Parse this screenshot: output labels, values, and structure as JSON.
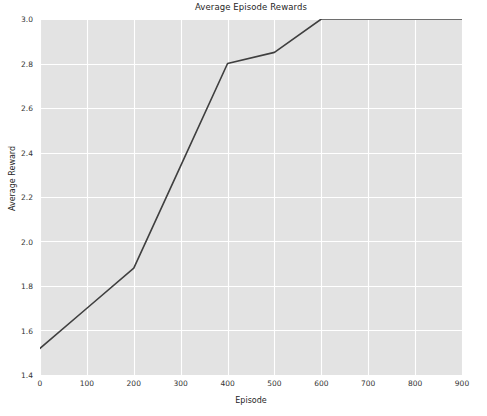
{
  "chart_data": {
    "type": "line",
    "title": "Average Episode Rewards",
    "xlabel": "Episode",
    "ylabel": "Average Reward",
    "xlim": [
      0,
      900
    ],
    "ylim": [
      1.4,
      3.0
    ],
    "xticks": [
      0,
      100,
      200,
      300,
      400,
      500,
      600,
      700,
      800,
      900
    ],
    "xtick_labels": [
      "0",
      "100",
      "200",
      "300",
      "400",
      "500",
      "600",
      "700",
      "800",
      "900"
    ],
    "yticks": [
      1.4,
      1.6,
      1.8,
      2.0,
      2.2,
      2.4,
      2.6,
      2.8,
      3.0
    ],
    "ytick_labels": [
      "1.4",
      "1.6",
      "1.8",
      "2.0",
      "2.2",
      "2.4",
      "2.6",
      "2.8",
      "3.0"
    ],
    "grid": true,
    "legend": null,
    "series": [
      {
        "name": "Average Reward",
        "color": "#3f3f3f",
        "linewidth": 1.6,
        "x": [
          0,
          100,
          200,
          300,
          400,
          500,
          600,
          700,
          800,
          900
        ],
        "values": [
          1.52,
          1.7,
          1.88,
          2.34,
          2.8,
          2.85,
          3.0,
          3.0,
          3.0,
          3.0
        ]
      }
    ],
    "style": {
      "axes_facecolor": "#e3e3e3",
      "figure_facecolor": "#ffffff",
      "gridline_color": "#ffffff",
      "tick_color": "#333333"
    }
  }
}
